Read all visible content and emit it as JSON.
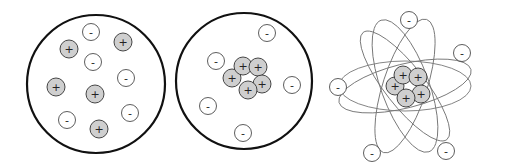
{
  "colors": {
    "proton_fill": "#cfcfcf",
    "electron_fill": "#ffffff",
    "stroke": "#333333",
    "boundary": "#111111",
    "orbit": "#777777"
  },
  "symbols": {
    "proton": "+",
    "electron": "-"
  },
  "models": [
    {
      "name": "plum-pudding-model",
      "boundary": {
        "cx": 96,
        "cy": 84,
        "r": 69
      },
      "particles": [
        {
          "type": "electron",
          "x": 91,
          "y": 32
        },
        {
          "type": "electron",
          "x": 93,
          "y": 62
        },
        {
          "type": "electron",
          "x": 126,
          "y": 78
        },
        {
          "type": "electron",
          "x": 130,
          "y": 113
        },
        {
          "type": "electron",
          "x": 67,
          "y": 120
        },
        {
          "type": "proton",
          "x": 69,
          "y": 49
        },
        {
          "type": "proton",
          "x": 123,
          "y": 42
        },
        {
          "type": "proton",
          "x": 56,
          "y": 87
        },
        {
          "type": "proton",
          "x": 95,
          "y": 94
        },
        {
          "type": "proton",
          "x": 99,
          "y": 129
        }
      ]
    },
    {
      "name": "nuclear-model",
      "boundary": {
        "cx": 244,
        "cy": 81,
        "r": 68
      },
      "particles": [
        {
          "type": "proton",
          "x": 232,
          "y": 78
        },
        {
          "type": "proton",
          "x": 243,
          "y": 66
        },
        {
          "type": "proton",
          "x": 258,
          "y": 67
        },
        {
          "type": "proton",
          "x": 262,
          "y": 84
        },
        {
          "type": "proton",
          "x": 248,
          "y": 90
        },
        {
          "type": "electron",
          "x": 267,
          "y": 33
        },
        {
          "type": "electron",
          "x": 216,
          "y": 61
        },
        {
          "type": "electron",
          "x": 292,
          "y": 85
        },
        {
          "type": "electron",
          "x": 208,
          "y": 106
        },
        {
          "type": "electron",
          "x": 243,
          "y": 133
        }
      ]
    },
    {
      "name": "planetary-model",
      "orbits": [
        {
          "cx": 405,
          "cy": 86,
          "rx": 66,
          "ry": 25,
          "rotate": 0
        },
        {
          "cx": 405,
          "cy": 86,
          "rx": 68,
          "ry": 22,
          "rotate": -14
        },
        {
          "cx": 405,
          "cy": 86,
          "rx": 70,
          "ry": 24,
          "rotate": 70
        },
        {
          "cx": 405,
          "cy": 86,
          "rx": 70,
          "ry": 22,
          "rotate": -72
        },
        {
          "cx": 405,
          "cy": 86,
          "rx": 68,
          "ry": 20,
          "rotate": 52
        }
      ],
      "particles": [
        {
          "type": "proton",
          "x": 395,
          "y": 86
        },
        {
          "type": "proton",
          "x": 403,
          "y": 75
        },
        {
          "type": "proton",
          "x": 418,
          "y": 77
        },
        {
          "type": "proton",
          "x": 421,
          "y": 94
        },
        {
          "type": "proton",
          "x": 406,
          "y": 98
        },
        {
          "type": "electron",
          "x": 409,
          "y": 20
        },
        {
          "type": "electron",
          "x": 462,
          "y": 53
        },
        {
          "type": "electron",
          "x": 338,
          "y": 87
        },
        {
          "type": "electron",
          "x": 372,
          "y": 153
        },
        {
          "type": "electron",
          "x": 446,
          "y": 151
        }
      ]
    }
  ]
}
